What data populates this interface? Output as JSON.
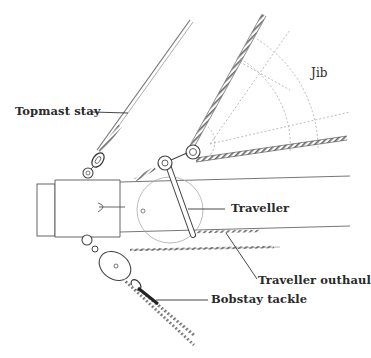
{
  "diagram": {
    "colors": {
      "background": "#ffffff",
      "ink": "#2a2a2a",
      "rope": "#555555",
      "dashed_panel_lines": "#aaaaaa"
    },
    "labels": {
      "topmast_stay": "Topmast stay",
      "jib": "Jib",
      "traveller": "Traveller",
      "traveller_outhaul": "Traveller outhaul",
      "bobstay_tackle": "Bobstay tackle"
    }
  }
}
